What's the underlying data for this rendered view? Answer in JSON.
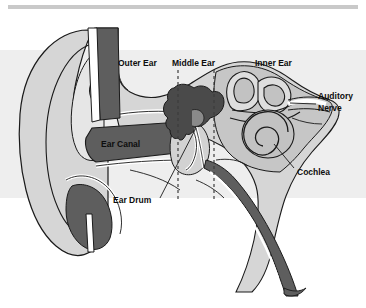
{
  "diagram": {
    "type": "cross-section-illustration",
    "canvas": {
      "width": 366,
      "height": 308
    },
    "palette": {
      "background": "#ffffff",
      "top_rule": "#c9c9c9",
      "band": "#ededed",
      "tissue_light": "#d6d6d6",
      "tissue_mid": "#bfbfbf",
      "tissue_dark": "#5e5e5e",
      "tissue_darkest": "#4a4a4a",
      "outline": "#1a1a1a",
      "white": "#ffffff",
      "label_text": "#0d0d0d",
      "dashed_divider": "#3c3c3c"
    },
    "labels": [
      {
        "id": "outer-ear",
        "text": "Outer Ear",
        "x": 118,
        "y": 66,
        "anchor": "start"
      },
      {
        "id": "middle-ear",
        "text": "Middle Ear",
        "x": 172,
        "y": 66,
        "anchor": "start"
      },
      {
        "id": "inner-ear",
        "text": "Inner Ear",
        "x": 255,
        "y": 66,
        "anchor": "start"
      },
      {
        "id": "auditory-nerve-1",
        "text": "Auditory",
        "x": 318,
        "y": 99,
        "anchor": "start"
      },
      {
        "id": "auditory-nerve-2",
        "text": "Nerve",
        "x": 318,
        "y": 111,
        "anchor": "start"
      },
      {
        "id": "ear-canal",
        "text": "Ear Canal",
        "x": 101,
        "y": 147,
        "anchor": "start"
      },
      {
        "id": "cochlea",
        "text": "Cochlea",
        "x": 297,
        "y": 175,
        "anchor": "start"
      },
      {
        "id": "ear-drum",
        "text": "Ear Drum",
        "x": 113,
        "y": 203,
        "anchor": "start"
      }
    ],
    "dividers": [
      {
        "id": "outer-middle-boundary",
        "x": 178,
        "y1": 70,
        "y2": 200
      },
      {
        "id": "middle-inner-boundary",
        "x": 214,
        "y1": 70,
        "y2": 200
      }
    ],
    "leader_lines": [
      {
        "id": "ear-drum-leader",
        "from_x": 160,
        "from_y": 198,
        "to_x": 196,
        "to_y": 126
      },
      {
        "id": "cochlea-leader",
        "from_x": 294,
        "from_y": 168,
        "to_x": 273,
        "to_y": 143
      },
      {
        "id": "auditory-nerve-leader",
        "from_x": 316,
        "from_y": 104,
        "to_x": 288,
        "to_y": 102
      }
    ],
    "parts": [
      "pinna",
      "ear-canal",
      "ear-drum",
      "ossicles",
      "semicircular-canals",
      "cochlea",
      "auditory-nerve",
      "eustachian-tube",
      "ear-lobe"
    ]
  }
}
